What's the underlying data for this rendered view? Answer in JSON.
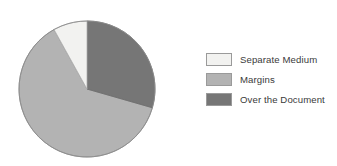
{
  "chart_data": {
    "type": "pie",
    "title": "",
    "categories": [
      "Separate Medium",
      "Margins",
      "Over the Document"
    ],
    "values": [
      8,
      62.5,
      29.5
    ],
    "units": "percent",
    "colors": [
      "#f2f2f0",
      "#b3b3b3",
      "#767676"
    ],
    "legend_position": "right",
    "grid": false,
    "start_angle_deg": 0,
    "direction": "clockwise",
    "slice_order": [
      "Over the Document",
      "Margins",
      "Separate Medium"
    ],
    "slices": [
      {
        "label": "Over the Document",
        "value": 29.5,
        "color": "#767676",
        "start_deg": 0,
        "end_deg": 106
      },
      {
        "label": "Margins",
        "value": 62.5,
        "color": "#b3b3b3",
        "start_deg": 106,
        "end_deg": 331
      },
      {
        "label": "Separate Medium",
        "value": 8.0,
        "color": "#f2f2f0",
        "start_deg": 331,
        "end_deg": 360
      }
    ]
  },
  "pie": {
    "center_x": 87,
    "center_y": 89,
    "radius": 68,
    "outline_color": "#8c8c8c"
  },
  "legend": {
    "items": [
      {
        "label": "Separate Medium",
        "color": "#f2f2f0"
      },
      {
        "label": "Margins",
        "color": "#b3b3b3"
      },
      {
        "label": "Over the Document",
        "color": "#767676"
      }
    ]
  }
}
